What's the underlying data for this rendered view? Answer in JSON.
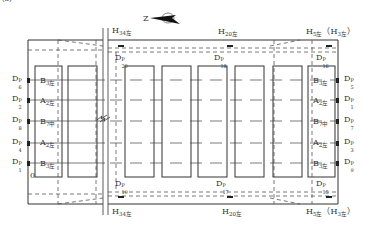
{
  "figure_label": "(a)",
  "north_arrow": {
    "letter": "Z",
    "icon": "north-arrow-icon"
  },
  "top_labels": [
    {
      "id": "h34-top",
      "text": "H",
      "sub": "34左",
      "x": 112,
      "y": 27
    },
    {
      "id": "h20-top",
      "text": "H",
      "sub": "20左",
      "x": 218,
      "y": 28
    },
    {
      "id": "h5-top",
      "text": "H",
      "sub": "5左",
      "suffix": "（H",
      "sub2": "3左",
      "end": "）",
      "x": 306,
      "y": 28
    }
  ],
  "bottom_labels": [
    {
      "id": "h34-bottom",
      "text": "H",
      "sub": "34左",
      "x": 112,
      "y": 208
    },
    {
      "id": "h20-bottom",
      "text": "H",
      "sub": "20左",
      "x": 222,
      "y": 208
    },
    {
      "id": "h5-bottom",
      "text": "H",
      "sub": "5左",
      "suffix": "（H",
      "sub2": "3左",
      "end": "）",
      "x": 306,
      "y": 208
    }
  ],
  "top_sensors": [
    {
      "id": "d20",
      "base": "D",
      "sup": "P",
      "sub": "20",
      "x": 115,
      "y": 54
    },
    {
      "id": "d18",
      "base": "D",
      "sup": "P",
      "sub": "18",
      "x": 214,
      "y": 54
    },
    {
      "id": "d16",
      "base": "D",
      "sup": "P",
      "sub": "16",
      "x": 316,
      "y": 54
    }
  ],
  "bottom_sensors": [
    {
      "id": "d19",
      "base": "D",
      "sup": "P",
      "sub": "19",
      "x": 115,
      "y": 180
    },
    {
      "id": "d17",
      "base": "D",
      "sup": "P",
      "sub": "17",
      "x": 216,
      "y": 180
    },
    {
      "id": "d15",
      "base": "D",
      "sup": "P",
      "sub": "15",
      "x": 316,
      "y": 180
    }
  ],
  "left_sensors": [
    {
      "id": "d6",
      "base": "D",
      "sup": "P",
      "sub": "6",
      "y": 80
    },
    {
      "id": "d2",
      "base": "D",
      "sup": "P",
      "sub": "2",
      "y": 100
    },
    {
      "id": "d8",
      "base": "D",
      "sup": "P",
      "sub": "8",
      "y": 121
    },
    {
      "id": "d4",
      "base": "D",
      "sup": "P",
      "sub": "4",
      "y": 143
    },
    {
      "id": "d1",
      "base": "D",
      "sup": "P",
      "sub": "1",
      "y": 163
    }
  ],
  "right_sensors": [
    {
      "id": "d5r",
      "base": "D",
      "sup": "P",
      "sub": "5",
      "y": 80
    },
    {
      "id": "d1r",
      "base": "D",
      "sup": "P",
      "sub": "1",
      "y": 100
    },
    {
      "id": "d7r",
      "base": "D",
      "sup": "P",
      "sub": "7",
      "y": 121
    },
    {
      "id": "d3r",
      "base": "D",
      "sup": "P",
      "sub": "3",
      "y": 143
    },
    {
      "id": "d9r",
      "base": "D",
      "sup": "P",
      "sub": "9",
      "y": 163
    }
  ],
  "left_box_labels": [
    {
      "text": "B",
      "sub": "3左",
      "y": 81
    },
    {
      "text": "A",
      "sub": "2左",
      "y": 101
    },
    {
      "text": "B",
      "sub": "7中",
      "y": 122
    },
    {
      "text": "A",
      "sub": "2左",
      "y": 143
    },
    {
      "text": "B",
      "sub": "3左",
      "y": 164
    }
  ],
  "right_box_labels": [
    {
      "text": "B",
      "sub": "3左",
      "y": 81
    },
    {
      "text": "A",
      "sub": "2左",
      "y": 101
    },
    {
      "text": "B",
      "sub": "7中",
      "y": 122
    },
    {
      "text": "A",
      "sub": "2左",
      "y": 143
    },
    {
      "text": "B",
      "sub": "3左",
      "y": 164
    }
  ],
  "origin_label": "0",
  "colors": {
    "line": "#333333",
    "dash": "#555555",
    "background": "#ffffff"
  }
}
